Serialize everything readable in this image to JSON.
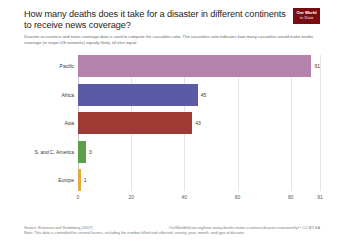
{
  "header": {
    "title": "How many deaths does it take for a disaster in different continents to receive news coverage?",
    "subtitle": "Disaster occurrence and news coverage data is used to compute the casualties ratio. The casualties ratio indicates how many casualties would make media coverage (in major US networks) equally likely, all else equal.",
    "logo_line1": "Our World",
    "logo_line2": "in Data"
  },
  "footer": {
    "source": "Source: Eisensee and Strömberg (2007)",
    "link": "OurWorldInData.org/how-many-deaths-make-a-natural-disaster-newsworthy/ • CC BY-SA",
    "note": "Note: This data is controlled for several factors, including the number killed and affected, country, year, month, and type of disaster."
  },
  "chart_data": {
    "type": "bar",
    "orientation": "horizontal",
    "title": "How many deaths does it take for a disaster in different continents to receive news coverage?",
    "xlabel": "",
    "ylabel": "",
    "xlim": [
      0,
      91
    ],
    "grid": true,
    "legend": "none",
    "xticks": [
      "0",
      "20",
      "40",
      "60",
      "80",
      "91"
    ],
    "xtick_values": [
      0,
      20,
      40,
      60,
      80,
      91
    ],
    "categories": [
      "Pacific",
      "Africa",
      "Asia",
      "S. and C. America",
      "Europe"
    ],
    "values": [
      91,
      45,
      43,
      3,
      1
    ],
    "value_labels": [
      "91",
      "45",
      "43",
      "3",
      "1"
    ],
    "colors": [
      "#b483ad",
      "#5a5aa6",
      "#9c3a33",
      "#5f9e48",
      "#e8a73f"
    ]
  }
}
